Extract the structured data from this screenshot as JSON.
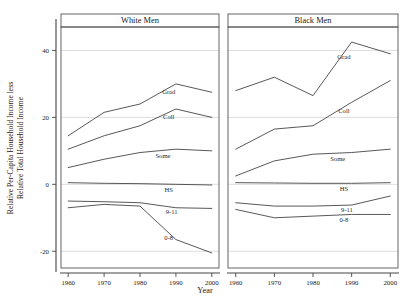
{
  "figure": {
    "axis_title_y_line1": "Relative Per-Capita Household Income less",
    "axis_title_y_line2": "Relative Total Household Income",
    "axis_title_x": "Year",
    "y_ticks": [
      40,
      20,
      0,
      -20
    ],
    "y_tick_labels": [
      "40",
      "20",
      "0",
      "-20"
    ],
    "x_ticks": [
      1960,
      1970,
      1980,
      1990,
      2000
    ],
    "x_tick_labels": [
      "1960",
      "1970",
      "1980",
      "1990",
      "2000"
    ],
    "panel_titles": [
      "White Men",
      "Black Men"
    ],
    "line_color": "#3a3a3a",
    "grid_color": "#cfcfcf",
    "frame_color": "#555555"
  },
  "chart_data": {
    "type": "line",
    "title": "",
    "xlabel": "Year",
    "ylabel": "Relative Per-Capita Household Income less Relative Total Household Income",
    "x": [
      1960,
      1970,
      1980,
      1990,
      2000
    ],
    "xlim": [
      1958,
      2002
    ],
    "ylim": [
      -25,
      47
    ],
    "yticks": [
      40,
      20,
      0,
      -20
    ],
    "grid": true,
    "legend": "inline-end-labels",
    "panels": [
      {
        "name": "White Men",
        "series": [
          {
            "name": "Grad",
            "label": "Grad",
            "values": [
              14.5,
              21.5,
              24.0,
              30.0,
              27.5
            ]
          },
          {
            "name": "Coll",
            "label": "Coll",
            "values": [
              10.5,
              14.5,
              17.5,
              22.5,
              20.0
            ]
          },
          {
            "name": "Some",
            "label": "Some",
            "values": [
              5.0,
              7.5,
              9.5,
              10.5,
              10.0
            ]
          },
          {
            "name": "HS",
            "label": "HS",
            "values": [
              0.5,
              0.3,
              0.2,
              0.0,
              -0.2
            ]
          },
          {
            "name": "9-11",
            "label": "9-11",
            "values": [
              -5.0,
              -5.2,
              -5.5,
              -7.0,
              -7.2
            ]
          },
          {
            "name": "0-8",
            "label": "0-8",
            "values": [
              -7.0,
              -6.0,
              -6.5,
              -16.5,
              -20.5
            ]
          }
        ]
      },
      {
        "name": "Black Men",
        "series": [
          {
            "name": "Grad",
            "label": "Grad",
            "values": [
              28.0,
              32.0,
              26.5,
              42.5,
              39.0
            ]
          },
          {
            "name": "Coll",
            "label": "Coll",
            "values": [
              10.5,
              16.5,
              17.5,
              24.5,
              31.0
            ]
          },
          {
            "name": "Some",
            "label": "Some",
            "values": [
              2.5,
              7.0,
              9.0,
              9.5,
              10.5
            ]
          },
          {
            "name": "HS",
            "label": "HS",
            "values": [
              0.5,
              0.4,
              0.3,
              0.3,
              0.5
            ]
          },
          {
            "name": "9-11",
            "label": "9-11",
            "values": [
              -5.5,
              -6.5,
              -6.5,
              -6.2,
              -3.5
            ]
          },
          {
            "name": "0-8",
            "label": "0-8",
            "values": [
              -7.5,
              -10.0,
              -9.5,
              -9.0,
              -9.0
            ]
          }
        ]
      }
    ]
  }
}
